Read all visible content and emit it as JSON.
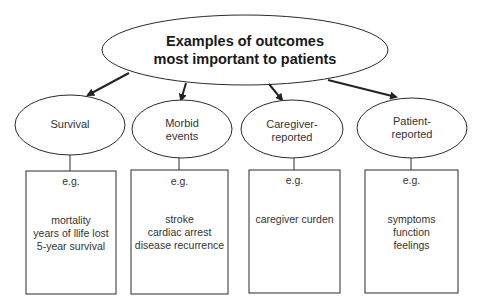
{
  "root": {
    "title_line1": "Examples of outcomes",
    "title_line2": "most important to patients"
  },
  "categories": [
    {
      "label_line1": "Survival",
      "label_line2": "",
      "eg": "e.g.",
      "examples": [
        "mortality",
        "years of llife lost",
        "5-year survival"
      ]
    },
    {
      "label_line1": "Morbid",
      "label_line2": "events",
      "eg": "e.g.",
      "examples": [
        "stroke",
        "cardiac arrest",
        "disease recurrence"
      ]
    },
    {
      "label_line1": "Caregiver-",
      "label_line2": "reported",
      "eg": "e.g.",
      "examples": [
        "caregiver curden"
      ]
    },
    {
      "label_line1": "Patient-",
      "label_line2": "reported",
      "eg": "e.g.",
      "examples": [
        "symptoms",
        "function",
        "feelings"
      ]
    }
  ],
  "colors": {
    "stroke": "#2a2a2a",
    "background": "#ffffff"
  }
}
